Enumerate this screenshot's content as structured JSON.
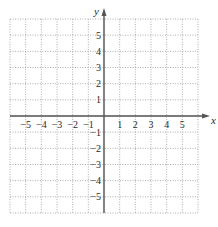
{
  "chart_data": {
    "type": "scatter",
    "title": "",
    "xlabel": "x",
    "ylabel": "y",
    "xlim": [
      -6,
      6
    ],
    "ylim": [
      -6,
      6
    ],
    "grid": true,
    "grid_style": "dotted",
    "x_ticks": [
      -5,
      -4,
      -3,
      -2,
      -1,
      1,
      2,
      3,
      4,
      5
    ],
    "y_ticks": [
      5,
      4,
      3,
      2,
      1,
      -1,
      -2,
      -3,
      -4,
      -5
    ],
    "x_tick_labels": [
      "−5",
      "−4",
      "−3",
      "−2",
      "−1",
      "1",
      "2",
      "3",
      "4",
      "5"
    ],
    "y_tick_labels": [
      "5",
      "4",
      "3",
      "2",
      "1",
      "−1",
      "−2",
      "−3",
      "−4",
      "−5"
    ],
    "series": [],
    "legend": null
  },
  "colors": {
    "axis": "#555555",
    "grid": "#999999",
    "text": "#2a2a2a"
  }
}
